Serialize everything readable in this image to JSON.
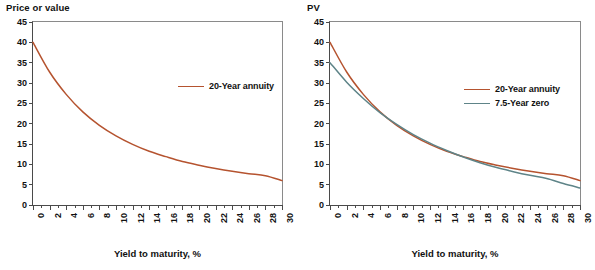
{
  "chart_data": [
    {
      "type": "line",
      "panel": "left",
      "title": "Price or value",
      "ylabel": "Price or value",
      "xlabel": "Yield to maturity, %",
      "xlim": [
        0,
        30
      ],
      "ylim": [
        0,
        45
      ],
      "yticks": [
        0,
        5,
        10,
        15,
        20,
        25,
        30,
        35,
        40,
        45
      ],
      "xticks": [
        0,
        2,
        4,
        6,
        8,
        10,
        12,
        14,
        16,
        18,
        20,
        22,
        24,
        26,
        28,
        30
      ],
      "xtick_minor_step": 1,
      "grid": false,
      "legend_position": "center-right",
      "series": [
        {
          "name": "20-Year annuity",
          "color": "#b5532f",
          "x": [
            0,
            2,
            4,
            6,
            8,
            10,
            12,
            14,
            16,
            18,
            20,
            22,
            24,
            26,
            28,
            30
          ],
          "values": [
            40.0,
            32.7,
            27.2,
            22.9,
            19.6,
            17.0,
            14.9,
            13.2,
            11.9,
            10.7,
            9.8,
            9.0,
            8.3,
            7.7,
            7.2,
            6.0
          ]
        }
      ]
    },
    {
      "type": "line",
      "panel": "right",
      "title": "PV",
      "ylabel": "PV",
      "xlabel": "Yield to maturity, %",
      "xlim": [
        0,
        30
      ],
      "ylim": [
        0,
        45
      ],
      "yticks": [
        0,
        5,
        10,
        15,
        20,
        25,
        30,
        35,
        40,
        45
      ],
      "xticks": [
        0,
        2,
        4,
        6,
        8,
        10,
        12,
        14,
        16,
        18,
        20,
        22,
        24,
        26,
        28,
        30
      ],
      "xtick_minor_step": 1,
      "grid": false,
      "legend_position": "center-right",
      "series": [
        {
          "name": "20-Year annuity",
          "color": "#b5532f",
          "x": [
            0,
            2,
            4,
            6,
            8,
            10,
            12,
            14,
            16,
            18,
            20,
            22,
            24,
            26,
            28,
            30
          ],
          "values": [
            40.0,
            32.7,
            27.2,
            22.9,
            19.6,
            17.0,
            14.9,
            13.2,
            11.9,
            10.7,
            9.8,
            9.0,
            8.3,
            7.7,
            7.2,
            6.0
          ]
        },
        {
          "name": "7.5-Year zero",
          "color": "#5e8488",
          "x": [
            0,
            2,
            4,
            6,
            8,
            10,
            12,
            14,
            16,
            18,
            20,
            22,
            24,
            26,
            28,
            30
          ],
          "values": [
            35.0,
            30.2,
            26.2,
            22.7,
            19.8,
            17.3,
            15.2,
            13.4,
            11.8,
            10.4,
            9.2,
            8.2,
            7.3,
            6.5,
            5.3,
            4.2
          ]
        }
      ]
    }
  ],
  "left_panel": {
    "y_axis_title": "Price or value",
    "x_axis_title": "Yield to maturity, %",
    "yticks": [
      "45",
      "40",
      "35",
      "30",
      "25",
      "20",
      "15",
      "10",
      "5",
      "0"
    ],
    "xticks": [
      "0",
      "2",
      "4",
      "6",
      "8",
      "10",
      "12",
      "14",
      "16",
      "18",
      "20",
      "22",
      "24",
      "26",
      "28",
      "30"
    ],
    "legend": [
      {
        "label": "20-Year annuity",
        "color": "#b5532f"
      }
    ]
  },
  "right_panel": {
    "y_axis_title": "PV",
    "x_axis_title": "Yield to maturity, %",
    "yticks": [
      "45",
      "40",
      "35",
      "30",
      "25",
      "20",
      "15",
      "10",
      "5",
      "0"
    ],
    "xticks": [
      "0",
      "2",
      "4",
      "6",
      "8",
      "10",
      "12",
      "14",
      "16",
      "18",
      "20",
      "22",
      "24",
      "26",
      "28",
      "30"
    ],
    "legend": [
      {
        "label": "20-Year annuity",
        "color": "#b5532f"
      },
      {
        "label": "7.5-Year zero",
        "color": "#5e8488"
      }
    ]
  },
  "colors": {
    "annuity": "#b5532f",
    "zero": "#5e8488",
    "axis": "#4a4a4a",
    "frame": "#8a8a8a",
    "text": "#111111",
    "background": "#ffffff"
  }
}
